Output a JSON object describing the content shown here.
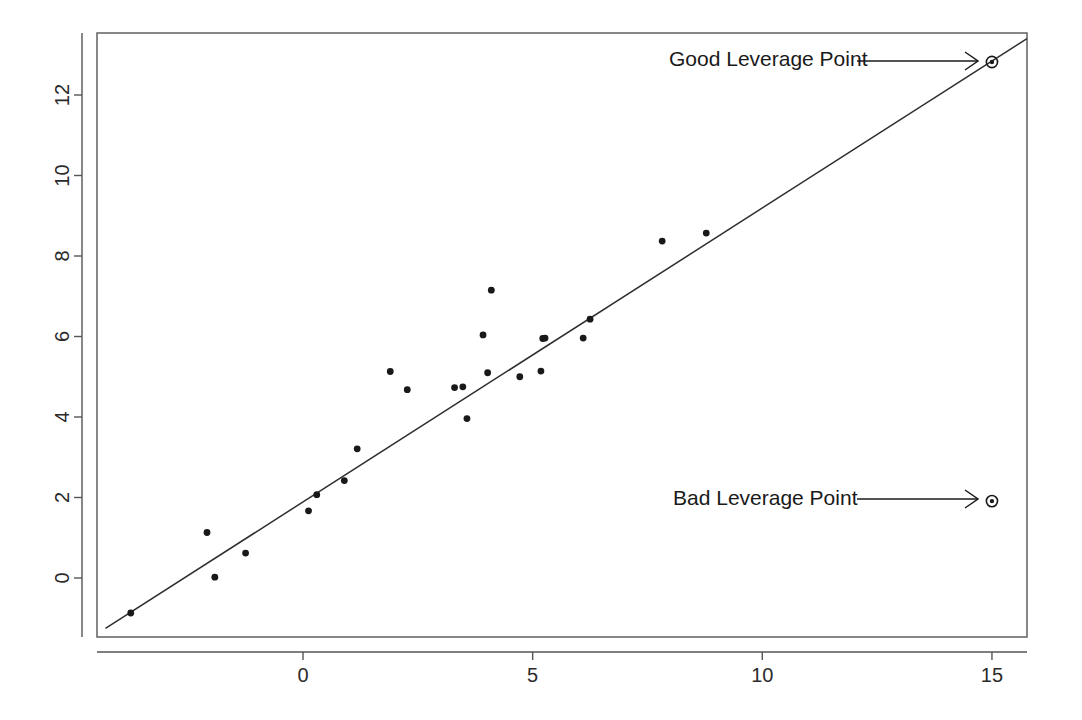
{
  "figure": {
    "background_color": "#ffffff",
    "ink_color": "#191919"
  },
  "chart_data": {
    "type": "scatter",
    "title": "",
    "subtitle": "",
    "xlabel": "",
    "ylabel": "",
    "grid": false,
    "legend": "none",
    "xlim": [
      -4.5,
      15.95
    ],
    "ylim": [
      -1.35,
      13.55
    ],
    "xticks": [
      0,
      5,
      10,
      15
    ],
    "xtick_labels": [
      "0",
      "5",
      "10",
      "15"
    ],
    "yticks": [
      0,
      2,
      4,
      6,
      8,
      10,
      12
    ],
    "ytick_labels": [
      "0",
      "2",
      "4",
      "6",
      "8",
      "10",
      "12"
    ],
    "ytick_label_rotation": -90,
    "series": [
      {
        "name": "bulk-observations",
        "marker": "filled-circle",
        "points": [
          {
            "x": -3.75,
            "y": -0.87
          },
          {
            "x": -2.09,
            "y": 1.13
          },
          {
            "x": -1.92,
            "y": 0.02
          },
          {
            "x": -1.25,
            "y": 0.62
          },
          {
            "x": 0.12,
            "y": 1.67
          },
          {
            "x": 0.3,
            "y": 2.07
          },
          {
            "x": 0.9,
            "y": 2.42
          },
          {
            "x": 1.18,
            "y": 3.21
          },
          {
            "x": 1.9,
            "y": 5.13
          },
          {
            "x": 2.27,
            "y": 4.68
          },
          {
            "x": 3.3,
            "y": 4.73
          },
          {
            "x": 3.48,
            "y": 4.75
          },
          {
            "x": 3.57,
            "y": 3.96
          },
          {
            "x": 3.92,
            "y": 6.04
          },
          {
            "x": 4.02,
            "y": 5.1
          },
          {
            "x": 4.1,
            "y": 7.15
          },
          {
            "x": 4.72,
            "y": 5.0
          },
          {
            "x": 5.18,
            "y": 5.14
          },
          {
            "x": 5.22,
            "y": 5.95
          },
          {
            "x": 5.27,
            "y": 5.96
          },
          {
            "x": 6.1,
            "y": 5.96
          },
          {
            "x": 6.25,
            "y": 6.43
          },
          {
            "x": 7.82,
            "y": 8.37
          },
          {
            "x": 8.78,
            "y": 8.57
          }
        ]
      },
      {
        "name": "leverage-observations",
        "marker": "circled-dot",
        "points": [
          {
            "x": 15.0,
            "y": 12.82,
            "label_key": "good"
          },
          {
            "x": 15.0,
            "y": 1.91,
            "label_key": "bad"
          }
        ]
      }
    ],
    "fit_line": {
      "name": "least-squares-fit",
      "style": "solid",
      "x_start": -4.3,
      "y_start": -1.25,
      "x_end": 15.9,
      "y_end": 13.5
    },
    "annotations": [
      {
        "key": "good",
        "text": "Good Leverage Point",
        "text_x": 669,
        "text_y": 66,
        "arrow_from_x": 857,
        "arrow_to_x": 978,
        "arrow_y": 61
      },
      {
        "key": "bad",
        "text": "Bad Leverage Point",
        "text_x": 673,
        "text_y": 505,
        "arrow_from_x": 857,
        "arrow_to_x": 978,
        "arrow_y": 499
      }
    ]
  },
  "plot_geometry": {
    "box_left": 97,
    "box_right": 1027,
    "box_top": 33,
    "box_bottom": 637,
    "x_axis_y": 652,
    "y_axis_x": 82,
    "px_per_x_unit": 45.93,
    "px_per_y_unit": 40.25,
    "x_origin_px": 303,
    "y_origin_px": 578,
    "tick_length": 8,
    "point_radius": 3.4,
    "leverage_ring_radius": 5.6,
    "leverage_core_radius": 2.2
  }
}
